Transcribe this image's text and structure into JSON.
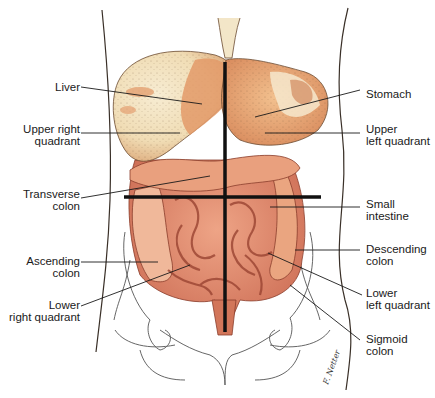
{
  "figure": {
    "colors": {
      "outline": "#3a3028",
      "organ_light": "#f3e6c8",
      "organ_mid": "#e7a977",
      "organ_dark": "#c8664a",
      "intestine": "#e08f72",
      "intestine_dark": "#b85a44",
      "quadrant_lines": "#111111",
      "leader_lines": "#1a1a1a",
      "bone": "#555555"
    },
    "labels_left": [
      {
        "id": "liver",
        "text": "Liver"
      },
      {
        "id": "upper-right-quadrant",
        "text": "Upper right\nquadrant"
      },
      {
        "id": "transverse-colon",
        "text": "Transverse\ncolon"
      },
      {
        "id": "ascending-colon",
        "text": "Ascending\ncolon"
      },
      {
        "id": "lower-right-quadrant",
        "text": "Lower\nright quadrant"
      }
    ],
    "labels_right": [
      {
        "id": "stomach",
        "text": "Stomach"
      },
      {
        "id": "upper-left-quadrant",
        "text": "Upper\nleft quadrant"
      },
      {
        "id": "small-intestine",
        "text": "Small\nintestine"
      },
      {
        "id": "descending-colon",
        "text": "Descending\ncolon"
      },
      {
        "id": "lower-left-quadrant",
        "text": "Lower\nleft quadrant"
      },
      {
        "id": "sigmoid-colon",
        "text": "Sigmoid\ncolon"
      }
    ],
    "signature": "F. Netter-style signature"
  }
}
